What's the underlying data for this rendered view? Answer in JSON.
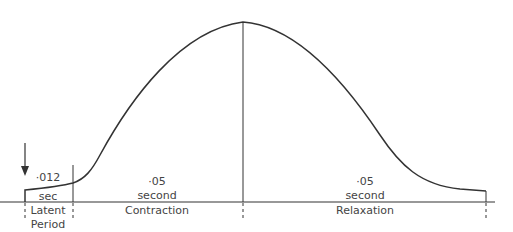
{
  "diagram": {
    "stimulus_marker": "arrow",
    "phases": [
      {
        "name": "Latent Period",
        "name_line1": "Latent",
        "name_line2": "Period",
        "duration_value": "·012",
        "duration_unit": "sec"
      },
      {
        "name": "Contraction",
        "duration_value": "·05",
        "duration_unit": "second"
      },
      {
        "name": "Relaxation",
        "duration_value": "·05",
        "duration_unit": "second"
      }
    ],
    "colors": {
      "line": "#333333",
      "background": "#ffffff"
    }
  }
}
